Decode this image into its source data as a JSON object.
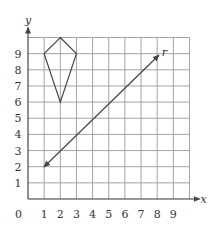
{
  "diagram": {
    "type": "coordinate-grid",
    "x_axis": {
      "label": "x",
      "min": 0,
      "max": 10,
      "tick_labels": [
        "1",
        "2",
        "3",
        "4",
        "5",
        "6",
        "7",
        "8",
        "9"
      ]
    },
    "y_axis": {
      "label": "y",
      "min": 0,
      "max": 10,
      "tick_labels": [
        "1",
        "2",
        "3",
        "4",
        "5",
        "6",
        "7",
        "8",
        "9"
      ]
    },
    "origin_label": "0",
    "kite": {
      "vertices": [
        [
          2,
          10
        ],
        [
          3,
          9
        ],
        [
          2,
          6
        ],
        [
          1,
          9
        ]
      ]
    },
    "line": {
      "label": "r",
      "from": [
        1,
        2
      ],
      "to": [
        8.1,
        8.9
      ],
      "arrows": "both"
    }
  }
}
